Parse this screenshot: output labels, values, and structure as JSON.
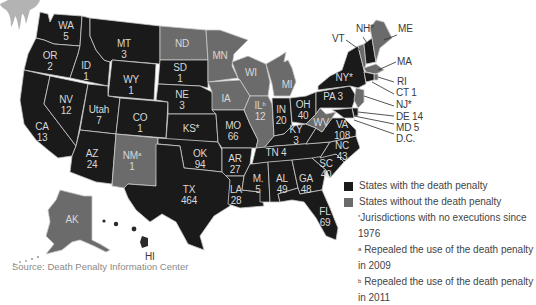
{
  "colors": {
    "with_death_penalty": "#1a1a1a",
    "without_death_penalty": "#6b6b6b",
    "borders": "#c9c9c9",
    "background": "#ffffff"
  },
  "legend": {
    "with": "States with the death penalty",
    "without": "States without the death penalty",
    "note_star_marker": "*",
    "note_star": "Jurisdictions with no executions since 1976",
    "note_a_marker": "a",
    "note_a": "Repealed the use of the death penalty in 2009",
    "note_b_marker": "b",
    "note_b": "Repealed the use of the death penalty in 2011"
  },
  "source": "Source: Death Penalty Information Center",
  "states": {
    "WA": {
      "label": "WA",
      "value": "5",
      "status": "with"
    },
    "OR": {
      "label": "OR",
      "value": "2",
      "status": "with"
    },
    "CA": {
      "label": "CA",
      "value": "13",
      "status": "with"
    },
    "ID": {
      "label": "ID",
      "value": "1",
      "status": "with"
    },
    "NV": {
      "label": "NV",
      "value": "12",
      "status": "with"
    },
    "MT": {
      "label": "MT",
      "value": "3",
      "status": "with"
    },
    "WY": {
      "label": "WY",
      "value": "1",
      "status": "with"
    },
    "UT": {
      "label": "Utah",
      "value": "7",
      "status": "with"
    },
    "CO": {
      "label": "CO",
      "value": "1",
      "status": "with"
    },
    "AZ": {
      "label": "AZ",
      "value": "24",
      "status": "with"
    },
    "NM": {
      "label": "NM",
      "marker": "a",
      "value": "1",
      "status": "without"
    },
    "ND": {
      "label": "ND",
      "value": "",
      "status": "without"
    },
    "SD": {
      "label": "SD",
      "value": "1",
      "status": "with"
    },
    "NE": {
      "label": "NE",
      "value": "3",
      "status": "with"
    },
    "KS": {
      "label": "KS*",
      "value": "",
      "status": "with"
    },
    "OK": {
      "label": "OK",
      "value": "94",
      "status": "with"
    },
    "TX": {
      "label": "TX",
      "value": "464",
      "status": "with"
    },
    "MN": {
      "label": "MN",
      "value": "",
      "status": "without"
    },
    "IA": {
      "label": "IA",
      "value": "",
      "status": "without"
    },
    "MO": {
      "label": "MO",
      "value": "66",
      "status": "with"
    },
    "AR": {
      "label": "AR",
      "value": "27",
      "status": "with"
    },
    "LA": {
      "label": "LA",
      "value": "28",
      "status": "with"
    },
    "WI": {
      "label": "WI",
      "value": "",
      "status": "without"
    },
    "IL": {
      "label": "IL",
      "marker": "b",
      "value": "12",
      "status": "without"
    },
    "MI": {
      "label": "MI",
      "value": "",
      "status": "without"
    },
    "IN": {
      "label": "IN",
      "value": "20",
      "status": "with"
    },
    "OH": {
      "label": "OH",
      "value": "40",
      "status": "with"
    },
    "KY": {
      "label": "KY",
      "value": "3",
      "status": "with"
    },
    "TN": {
      "label": "TN 4",
      "value": "",
      "status": "with"
    },
    "MS": {
      "label": "M.",
      "value": "5",
      "status": "with"
    },
    "AL": {
      "label": "AL",
      "value": "49",
      "status": "with"
    },
    "GA": {
      "label": "GA",
      "value": "48",
      "status": "with"
    },
    "FL": {
      "label": "FL",
      "value": "69",
      "status": "with"
    },
    "SC": {
      "label": "SC",
      "value": "40",
      "status": "with"
    },
    "NC": {
      "label": "NC",
      "value": "43",
      "status": "with"
    },
    "VA": {
      "label": "VA",
      "value": "108",
      "status": "with"
    },
    "WV": {
      "label": "WV",
      "value": "",
      "status": "without"
    },
    "PA": {
      "label": "PA 3",
      "value": "",
      "status": "with"
    },
    "NY": {
      "label": "NY*",
      "value": "",
      "status": "with"
    },
    "VT": {
      "label": "VT",
      "value": "",
      "status": "without"
    },
    "NH": {
      "label": "NH*",
      "value": "",
      "status": "with"
    },
    "ME": {
      "label": "ME",
      "value": "",
      "status": "without"
    },
    "MA": {
      "label": "MA",
      "value": "",
      "status": "without"
    },
    "RI": {
      "label": "RI",
      "value": "",
      "status": "without"
    },
    "CT": {
      "label": "CT 1",
      "value": "",
      "status": "with"
    },
    "NJ": {
      "label": "NJ*",
      "value": "",
      "status": "without"
    },
    "DE": {
      "label": "DE 14",
      "value": "",
      "status": "with"
    },
    "MD": {
      "label": "MD 5",
      "value": "",
      "status": "with"
    },
    "DC": {
      "label": "D.C.",
      "value": "",
      "status": "without"
    },
    "AK": {
      "label": "AK",
      "value": "",
      "status": "without"
    },
    "HI": {
      "label": "HI",
      "value": "",
      "status": "without"
    }
  }
}
